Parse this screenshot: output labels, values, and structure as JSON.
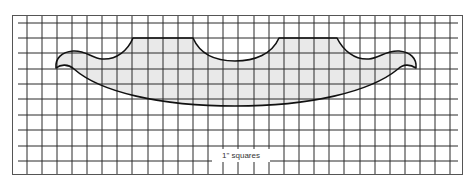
{
  "diagram": {
    "type": "pattern-template-on-grid",
    "grid": {
      "unit_label": "1\" squares",
      "columns": 30,
      "rows": 10,
      "spacing_px": 15.2,
      "line_color": "#2b2b2b",
      "border_color": "#555555"
    },
    "shape": {
      "description": "Symmetrical scalloped apron/bracket template with bird-beak tips, two flat tops and a central semicircular cutout, curved bottom edge",
      "fill_color": "#e9e9e9",
      "stroke_color": "#111111"
    },
    "caption": "1\" squares"
  }
}
